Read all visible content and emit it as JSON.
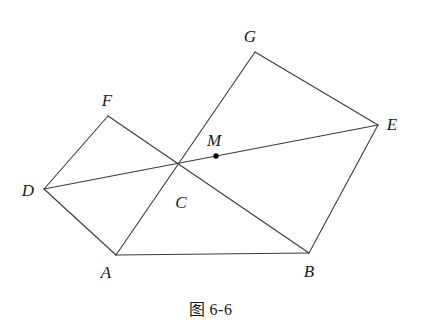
{
  "figure": {
    "caption": "图 6-6",
    "stroke_color": "#3a3a3a",
    "label_color": "#1a1a1a",
    "background_color": "#ffffff",
    "stroke_width": 1.1,
    "marked_point_color": "#000000"
  },
  "points": {
    "A": {
      "label": "A",
      "x": 116,
      "y": 255,
      "label_x": 106,
      "label_y": 272
    },
    "B": {
      "label": "B",
      "x": 309,
      "y": 253,
      "label_x": 309,
      "label_y": 271
    },
    "C": {
      "label": "C",
      "x": 180,
      "y": 182,
      "label_x": 181,
      "label_y": 202
    },
    "D": {
      "label": "D",
      "x": 44,
      "y": 189,
      "label_x": 28,
      "label_y": 190
    },
    "E": {
      "label": "E",
      "x": 378,
      "y": 125,
      "label_x": 392,
      "label_y": 124
    },
    "F": {
      "label": "F",
      "x": 108,
      "y": 116,
      "label_x": 107,
      "label_y": 100
    },
    "G": {
      "label": "G",
      "x": 255,
      "y": 52,
      "label_x": 250,
      "label_y": 36
    },
    "M": {
      "label": "M",
      "x": 216,
      "y": 156,
      "label_x": 214,
      "label_y": 140
    }
  },
  "segments": [
    {
      "name": "segment-DF",
      "from": "D",
      "to": "F"
    },
    {
      "name": "segment-FB-through-C",
      "from": "F",
      "to": "B"
    },
    {
      "name": "segment-DA",
      "from": "D",
      "to": "A"
    },
    {
      "name": "segment-AB",
      "from": "A",
      "to": "B"
    },
    {
      "name": "segment-BE",
      "from": "B",
      "to": "E"
    },
    {
      "name": "segment-DE",
      "from": "D",
      "to": "E"
    },
    {
      "name": "segment-AG",
      "from": "A",
      "to": "G"
    },
    {
      "name": "segment-GE",
      "from": "G",
      "to": "E"
    }
  ],
  "marked_points": [
    "M"
  ]
}
